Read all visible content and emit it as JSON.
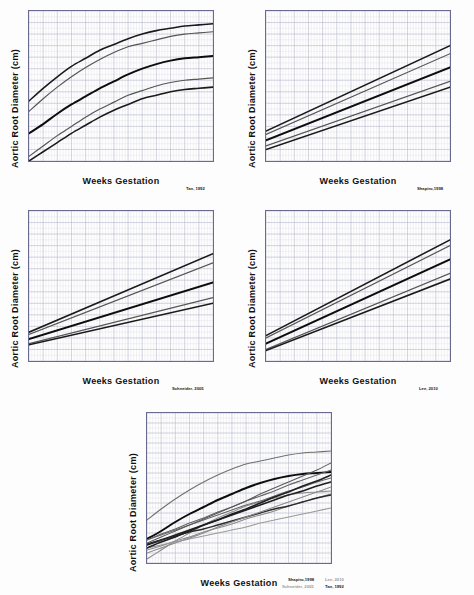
{
  "figure": {
    "axis_titles": {
      "y": "Aortic Root  Diameter (cm)",
      "x": "Weeks Gestation"
    },
    "percentile_labels": {
      "p99": "99",
      "p95": "95",
      "p50": "50",
      "p05": "05",
      "p01": "01"
    },
    "citations": {
      "tan": "Tan, 1992",
      "shapiro": "Shapiro,1998",
      "schneider": "Schneider, 2005",
      "lee": "Lee, 2010"
    }
  },
  "chart_data": [
    {
      "id": "tan",
      "type": "line",
      "title": "",
      "citation": "Tan, 1992",
      "xlabel": "Weeks Gestation",
      "ylabel": "Aortic Root  Diameter (cm)",
      "xlim": [
        14,
        40
      ],
      "ylim": [
        0,
        1.3
      ],
      "yticks": [
        0,
        0.1,
        0.2,
        0.3,
        0.4,
        0.5,
        0.6,
        0.7,
        0.8,
        0.9,
        1,
        1.1,
        1.2,
        1.3
      ],
      "ytick_labels": [
        "0",
        "0.1",
        "0.2",
        "0.3",
        "0.4",
        "0.5",
        "0.6",
        "0.7",
        "0.8",
        "0.9",
        "1",
        "1.1",
        "1.2",
        "1.3"
      ],
      "xticks": [
        14,
        16,
        18,
        20,
        22,
        24,
        26,
        28,
        30,
        32,
        34,
        36,
        38,
        40
      ],
      "grid": true,
      "legend_position": "right-of-axis",
      "x": [
        14,
        16,
        18,
        20,
        22,
        24,
        26,
        28,
        30,
        32,
        34,
        36,
        38,
        40
      ],
      "series": [
        {
          "name": "99",
          "color": "#1a1a1a",
          "width": 1.6,
          "values": [
            0.52,
            0.63,
            0.73,
            0.82,
            0.89,
            0.96,
            1.01,
            1.06,
            1.1,
            1.13,
            1.15,
            1.17,
            1.18,
            1.19
          ]
        },
        {
          "name": "95",
          "color": "#555555",
          "width": 1.2,
          "values": [
            0.43,
            0.54,
            0.64,
            0.73,
            0.81,
            0.88,
            0.94,
            0.99,
            1.02,
            1.05,
            1.08,
            1.1,
            1.11,
            1.12
          ]
        },
        {
          "name": "50",
          "color": "#0d0d0d",
          "width": 2.0,
          "values": [
            0.24,
            0.32,
            0.41,
            0.49,
            0.56,
            0.63,
            0.69,
            0.75,
            0.8,
            0.84,
            0.87,
            0.89,
            0.9,
            0.91
          ]
        },
        {
          "name": "05",
          "color": "#555555",
          "width": 1.2,
          "values": [
            0.04,
            0.13,
            0.22,
            0.3,
            0.38,
            0.45,
            0.51,
            0.57,
            0.61,
            0.65,
            0.68,
            0.7,
            0.71,
            0.72
          ]
        },
        {
          "name": "01",
          "color": "#1a1a1a",
          "width": 1.6,
          "values": [
            0.0,
            0.08,
            0.16,
            0.24,
            0.31,
            0.38,
            0.44,
            0.49,
            0.54,
            0.57,
            0.6,
            0.62,
            0.63,
            0.64
          ]
        }
      ]
    },
    {
      "id": "shapiro",
      "type": "line",
      "title": "",
      "citation": "Shapiro,1998",
      "xlabel": "Weeks Gestation",
      "ylabel": "Aortic Root  Diameter (cm)",
      "xlim": [
        14,
        40
      ],
      "ylim": [
        0,
        1.3
      ],
      "yticks": [
        0,
        0.1,
        0.2,
        0.3,
        0.4,
        0.5,
        0.6,
        0.7,
        0.8,
        0.9,
        1,
        1.1,
        1.2,
        1.3
      ],
      "ytick_labels": [
        "0",
        "0.1",
        "0.2",
        "0.3",
        "0.4",
        "0.5",
        "0.6",
        "0.7",
        "0.8",
        "0.9",
        "1",
        "1.1",
        "1.2",
        "1.3"
      ],
      "xticks": [
        14,
        16,
        18,
        20,
        22,
        24,
        26,
        28,
        30,
        32,
        34,
        36,
        38,
        40
      ],
      "grid": true,
      "legend_position": "right-of-axis",
      "x": [
        14,
        40
      ],
      "series": [
        {
          "name": "99",
          "color": "#1a1a1a",
          "width": 1.6,
          "values": [
            0.26,
            1.0
          ]
        },
        {
          "name": "95",
          "color": "#555555",
          "width": 1.2,
          "values": [
            0.23,
            0.93
          ]
        },
        {
          "name": "50",
          "color": "#0d0d0d",
          "width": 2.0,
          "values": [
            0.18,
            0.81
          ]
        },
        {
          "name": "05",
          "color": "#555555",
          "width": 1.2,
          "values": [
            0.13,
            0.69
          ]
        },
        {
          "name": "01",
          "color": "#1a1a1a",
          "width": 1.6,
          "values": [
            0.1,
            0.64
          ]
        }
      ]
    },
    {
      "id": "schneider",
      "type": "line",
      "title": "",
      "citation": "Schneider, 2005",
      "xlabel": "Weeks Gestation",
      "ylabel": "Aortic Root  Diameter (cm)",
      "xlim": [
        14,
        40
      ],
      "ylim": [
        0,
        1.3
      ],
      "yticks": [
        0,
        0.1,
        0.2,
        0.3,
        0.4,
        0.5,
        0.6,
        0.7,
        0.8,
        0.9,
        1,
        1.1,
        1.2,
        1.3
      ],
      "ytick_labels": [
        "0",
        "0.1",
        "0.2",
        "0.3",
        "0.4",
        "0.5",
        "0.6",
        "0.7",
        "0.8",
        "0.9",
        "1",
        "1.1",
        "1.2",
        "1.3"
      ],
      "xticks": [
        14,
        16,
        18,
        20,
        22,
        24,
        26,
        28,
        30,
        32,
        34,
        36,
        38,
        40
      ],
      "grid": true,
      "legend_position": "right-of-axis",
      "x": [
        14,
        40
      ],
      "series": [
        {
          "name": "99",
          "color": "#1a1a1a",
          "width": 1.6,
          "values": [
            0.25,
            0.93
          ]
        },
        {
          "name": "95",
          "color": "#555555",
          "width": 1.2,
          "values": [
            0.23,
            0.85
          ]
        },
        {
          "name": "50",
          "color": "#0d0d0d",
          "width": 2.0,
          "values": [
            0.19,
            0.68
          ]
        },
        {
          "name": "05",
          "color": "#555555",
          "width": 1.2,
          "values": [
            0.15,
            0.55
          ]
        },
        {
          "name": "01",
          "color": "#1a1a1a",
          "width": 1.6,
          "values": [
            0.14,
            0.5
          ]
        }
      ]
    },
    {
      "id": "lee",
      "type": "line",
      "title": "",
      "citation": "Lee, 2010",
      "xlabel": "Weeks Gestation",
      "ylabel": "Aortic Root  Diameter (cm)",
      "xlim": [
        14,
        40
      ],
      "ylim": [
        0,
        1.3
      ],
      "yticks": [
        0,
        0.1,
        0.2,
        0.3,
        0.4,
        0.5,
        0.6,
        0.7,
        0.8,
        0.9,
        1,
        1.1,
        1.2,
        1.3
      ],
      "ytick_labels": [
        "0",
        "0.1",
        "0.2",
        "0.3",
        "0.4",
        "0.5",
        "0.6",
        "0.7",
        "0.8",
        "0.9",
        "1",
        "1.1",
        "1.2",
        "1.3"
      ],
      "xticks": [
        14,
        16,
        18,
        20,
        22,
        24,
        26,
        28,
        30,
        32,
        34,
        36,
        38,
        40
      ],
      "grid": true,
      "legend_position": "right-of-axis",
      "x": [
        14,
        40
      ],
      "series": [
        {
          "name": "99",
          "color": "#1a1a1a",
          "width": 1.6,
          "values": [
            0.22,
            1.05
          ]
        },
        {
          "name": "95",
          "color": "#555555",
          "width": 1.2,
          "values": [
            0.2,
            1.0
          ]
        },
        {
          "name": "50",
          "color": "#0d0d0d",
          "width": 2.0,
          "values": [
            0.15,
            0.88
          ]
        },
        {
          "name": "05",
          "color": "#555555",
          "width": 1.2,
          "values": [
            0.1,
            0.76
          ]
        },
        {
          "name": "01",
          "color": "#1a1a1a",
          "width": 1.6,
          "values": [
            0.09,
            0.71
          ]
        }
      ]
    },
    {
      "id": "combined",
      "type": "line",
      "title": "",
      "citation": "Shapiro, 1998 / Lee, 2010 / Schneider, 2005 / Tan, 1992",
      "xlabel": "Weeks Gestation",
      "ylabel": "Aortic Root  Diameter (cm)",
      "xlim": [
        14,
        40
      ],
      "ylim": [
        0,
        1.5
      ],
      "yticks": [
        0,
        0.1,
        0.2,
        0.3,
        0.4,
        0.5,
        0.6,
        0.7,
        0.8,
        0.9,
        1,
        1.1,
        1.2,
        1.3,
        1.4,
        1.5
      ],
      "ytick_labels": [
        "0",
        "0.1",
        "0.2",
        "0.3",
        "0.4",
        "0.5",
        "0.6",
        "0.7",
        "0.8",
        "0.9",
        "1",
        "1.1",
        "1.2",
        "1.3",
        "1.4",
        "1.5"
      ],
      "xticks": [
        14,
        16,
        18,
        20,
        22,
        24,
        26,
        28,
        30,
        32,
        34,
        36,
        38,
        40
      ],
      "grid": true,
      "legend_position": "right-of-axis",
      "right_labels": [
        "95",
        "50",
        "05"
      ],
      "x": [
        14,
        16,
        18,
        20,
        22,
        24,
        26,
        28,
        30,
        32,
        34,
        36,
        38,
        40
      ],
      "series": [
        {
          "name": "tan-95",
          "color": "#707070",
          "width": 1.1,
          "values": [
            0.43,
            0.54,
            0.64,
            0.73,
            0.81,
            0.88,
            0.94,
            0.99,
            1.02,
            1.05,
            1.08,
            1.1,
            1.11,
            1.12
          ]
        },
        {
          "name": "tan-50",
          "color": "#0d0d0d",
          "width": 2.0,
          "values": [
            0.24,
            0.32,
            0.41,
            0.49,
            0.56,
            0.63,
            0.69,
            0.75,
            0.8,
            0.84,
            0.87,
            0.89,
            0.9,
            0.91
          ]
        },
        {
          "name": "tan-05",
          "color": "#8c8c8c",
          "width": 1.1,
          "values": [
            0.04,
            0.13,
            0.22,
            0.3,
            0.38,
            0.45,
            0.51,
            0.57,
            0.61,
            0.65,
            0.68,
            0.7,
            0.71,
            0.72
          ]
        },
        {
          "name": "shapiro-95",
          "color": "#666666",
          "width": 1.1,
          "values": [
            0.23,
            0.29,
            0.34,
            0.4,
            0.45,
            0.51,
            0.56,
            0.62,
            0.67,
            0.72,
            0.78,
            0.83,
            0.88,
            0.93
          ]
        },
        {
          "name": "shapiro-50",
          "color": "#1f1f1f",
          "width": 1.7,
          "values": [
            0.18,
            0.23,
            0.28,
            0.33,
            0.38,
            0.43,
            0.48,
            0.53,
            0.58,
            0.63,
            0.68,
            0.72,
            0.77,
            0.81
          ]
        },
        {
          "name": "shapiro-05",
          "color": "#8c8c8c",
          "width": 1.1,
          "values": [
            0.13,
            0.17,
            0.22,
            0.26,
            0.31,
            0.35,
            0.39,
            0.44,
            0.48,
            0.52,
            0.57,
            0.61,
            0.65,
            0.69
          ]
        },
        {
          "name": "schneider-95",
          "color": "#666666",
          "width": 1.1,
          "values": [
            0.23,
            0.28,
            0.33,
            0.38,
            0.43,
            0.48,
            0.53,
            0.58,
            0.62,
            0.67,
            0.72,
            0.76,
            0.81,
            0.85
          ]
        },
        {
          "name": "schneider-50",
          "color": "#2b2b2b",
          "width": 1.5,
          "values": [
            0.19,
            0.23,
            0.27,
            0.31,
            0.34,
            0.38,
            0.42,
            0.46,
            0.5,
            0.54,
            0.57,
            0.61,
            0.65,
            0.68
          ]
        },
        {
          "name": "schneider-05",
          "color": "#9a9a9a",
          "width": 1.1,
          "values": [
            0.15,
            0.18,
            0.21,
            0.24,
            0.27,
            0.3,
            0.33,
            0.36,
            0.4,
            0.43,
            0.46,
            0.49,
            0.52,
            0.55
          ]
        },
        {
          "name": "lee-95",
          "color": "#5a5a5a",
          "width": 1.1,
          "values": [
            0.2,
            0.26,
            0.32,
            0.38,
            0.44,
            0.5,
            0.56,
            0.62,
            0.69,
            0.75,
            0.81,
            0.87,
            0.93,
            1.0
          ]
        },
        {
          "name": "lee-50",
          "color": "#1f1f1f",
          "width": 1.6,
          "values": [
            0.15,
            0.21,
            0.26,
            0.32,
            0.38,
            0.43,
            0.49,
            0.54,
            0.6,
            0.66,
            0.71,
            0.77,
            0.82,
            0.88
          ]
        },
        {
          "name": "lee-05",
          "color": "#8c8c8c",
          "width": 1.1,
          "values": [
            0.1,
            0.15,
            0.2,
            0.25,
            0.3,
            0.36,
            0.41,
            0.46,
            0.51,
            0.56,
            0.61,
            0.66,
            0.71,
            0.76
          ]
        }
      ]
    }
  ]
}
